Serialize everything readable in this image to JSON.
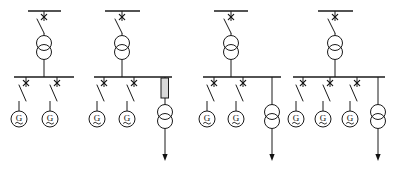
{
  "diagram": {
    "type": "electrical-single-line-diagram",
    "background_color": "#ffffff",
    "line_color": "#1a1a1a",
    "reactor_fill_color": "#d9d9d9",
    "symbols": {
      "generator_label": "G",
      "generator_icon": "generator-circle-icon",
      "transformer_icon": "two-winding-transformer-icon",
      "disconnector_icon": "disconnector-switch-icon",
      "switch_mark": "x",
      "reactor_icon": "reactor-rectangle-icon",
      "feeder_arrow_icon": "outgoing-feeder-arrow-icon",
      "busbar_icon": "busbar-icon"
    },
    "groups": [
      {
        "id": "group-1",
        "name": "scheme-variant-1",
        "hv_busbar": {
          "x1": 28,
          "x2": 61,
          "y": 11
        },
        "incoming_switch": {
          "x": 44,
          "y_top": 11,
          "y_bottom": 33,
          "mark_y": 17
        },
        "transformer": {
          "cx": 44,
          "cy_upper": 43,
          "cy_lower": 52,
          "r": 7.5
        },
        "lv_busbar": {
          "x1": 14,
          "x2": 74,
          "y": 77
        },
        "feeders": [
          {
            "x": 26,
            "type": "generator",
            "label": "G"
          },
          {
            "x": 57,
            "type": "generator",
            "label": "G"
          }
        ],
        "outgoing": null
      },
      {
        "id": "group-2",
        "name": "scheme-variant-2",
        "hv_busbar": {
          "x1": 105,
          "x2": 140,
          "y": 11
        },
        "incoming_switch": {
          "x": 122,
          "y_top": 11,
          "y_bottom": 33,
          "mark_y": 17
        },
        "transformer": {
          "cx": 122,
          "cy_upper": 43,
          "cy_lower": 52,
          "r": 7.5
        },
        "lv_busbar": {
          "x1": 94,
          "x2": 172,
          "y": 77
        },
        "feeders": [
          {
            "x": 104,
            "type": "generator",
            "label": "G"
          },
          {
            "x": 134,
            "type": "generator",
            "label": "G"
          }
        ],
        "outgoing": {
          "x": 165,
          "has_reactor": true,
          "reactor": {
            "x": 161,
            "y": 78,
            "w": 7.5,
            "h": 20
          },
          "transformer": {
            "cx": 165,
            "cy_upper": 112,
            "cy_lower": 121,
            "r": 7.5
          },
          "arrow_y_end": 161
        }
      },
      {
        "id": "group-3",
        "name": "scheme-variant-3",
        "hv_busbar": {
          "x1": 214,
          "x2": 248,
          "y": 11
        },
        "incoming_switch": {
          "x": 231,
          "y_top": 11,
          "y_bottom": 33,
          "mark_y": 17
        },
        "transformer": {
          "cx": 231,
          "cy_upper": 43,
          "cy_lower": 52,
          "r": 7.5
        },
        "lv_busbar": {
          "x1": 203,
          "x2": 281,
          "y": 77
        },
        "feeders": [
          {
            "x": 214,
            "type": "generator",
            "label": "G"
          },
          {
            "x": 243,
            "type": "generator",
            "label": "G"
          }
        ],
        "outgoing": {
          "x": 272,
          "has_reactor": false,
          "reactor": null,
          "transformer": {
            "cx": 272,
            "cy_upper": 112,
            "cy_lower": 121,
            "r": 7.5
          },
          "arrow_y_end": 161
        }
      },
      {
        "id": "group-4",
        "name": "scheme-variant-4",
        "hv_busbar": {
          "x1": 318,
          "x2": 353,
          "y": 11
        },
        "incoming_switch": {
          "x": 335,
          "y_top": 11,
          "y_bottom": 33,
          "mark_y": 17
        },
        "transformer": {
          "cx": 335,
          "cy_upper": 43,
          "cy_lower": 52,
          "r": 7.5
        },
        "lv_busbar": {
          "x1": 293,
          "x2": 385,
          "y": 77
        },
        "feeders": [
          {
            "x": 303,
            "type": "generator",
            "label": "G"
          },
          {
            "x": 330,
            "type": "generator",
            "label": "G"
          },
          {
            "x": 357,
            "type": "generator",
            "label": "G"
          }
        ],
        "outgoing": {
          "x": 378,
          "has_reactor": false,
          "reactor": null,
          "transformer": {
            "cx": 378,
            "cy_upper": 112,
            "cy_lower": 121,
            "r": 7.5
          },
          "arrow_y_end": 161
        }
      }
    ]
  }
}
